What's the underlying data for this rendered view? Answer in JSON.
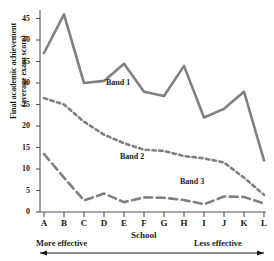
{
  "chart_data": {
    "type": "line",
    "title": "",
    "xlabel": "School",
    "ylabel": "Final academic achievement (average exam score)",
    "ylabel_line1": "Final academic achievement",
    "ylabel_line2": "(average exam score)",
    "categories": [
      "A",
      "B",
      "C",
      "D",
      "E",
      "F",
      "G",
      "H",
      "I",
      "J",
      "K",
      "L"
    ],
    "ylim": [
      0,
      47
    ],
    "yticks": [
      0,
      5,
      10,
      15,
      20,
      25,
      30,
      35,
      40,
      45
    ],
    "grid": false,
    "legend_position": "inline-annotations",
    "series": [
      {
        "name": "Band 1",
        "style": "solid",
        "color": "#808080",
        "values": [
          37,
          46,
          30,
          30.5,
          34.5,
          28,
          27,
          34,
          22,
          24,
          28,
          12
        ]
      },
      {
        "name": "Band 2",
        "style": "dotted",
        "color": "#808080",
        "values": [
          26.5,
          25,
          21,
          18,
          16,
          14.5,
          14.2,
          13,
          12.5,
          11.5,
          8,
          4
        ]
      },
      {
        "name": "Band 3",
        "style": "dashed",
        "color": "#808080",
        "values": [
          13.5,
          8,
          2.7,
          4.3,
          2.3,
          3.4,
          3.3,
          2.8,
          1.8,
          3.6,
          3.5,
          2
        ]
      }
    ],
    "annotations": [
      {
        "text": "Band 1",
        "x": 3.6,
        "y": 28.5
      },
      {
        "text": "Band 2",
        "x": 4.6,
        "y": 12.2
      },
      {
        "text": "Band 3",
        "x": 7.4,
        "y": 6.0
      }
    ],
    "axis_direction": {
      "left_label": "More effective",
      "right_label": "Less effective"
    }
  }
}
